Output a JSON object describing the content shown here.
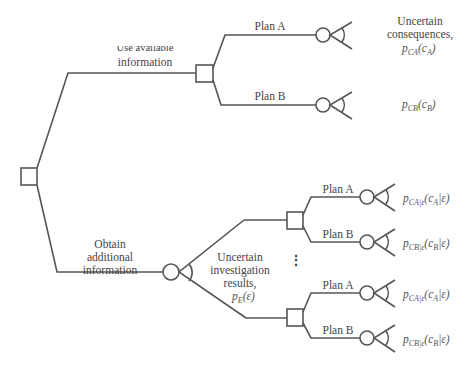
{
  "colors": {
    "line": "#555555",
    "text": "#444444",
    "background": "#ffffff"
  },
  "root": {
    "type": "decision",
    "shape": "square"
  },
  "branches": {
    "use_available": {
      "label_line1": "Use available",
      "label_line2": "information",
      "decision_node": "square",
      "plans": [
        {
          "label": "Plan A",
          "chance_node": "circle",
          "outcome_label_lines": [
            "Uncertain",
            "consequences,"
          ],
          "prob": {
            "p": "p",
            "sub": "CA",
            "arg": "c",
            "argsub": "A"
          }
        },
        {
          "label": "Plan B",
          "chance_node": "circle",
          "prob": {
            "p": "p",
            "sub": "CB",
            "arg": "c",
            "argsub": "B"
          }
        }
      ]
    },
    "obtain_additional": {
      "label_lines": [
        "Obtain",
        "additional",
        "information"
      ],
      "chance_node": "circle",
      "chance_label_lines": [
        "Uncertain",
        "investigation",
        "results,"
      ],
      "chance_prob": {
        "p": "p",
        "sub": "E",
        "arg": "(ε)"
      },
      "ellipsis": "⋮",
      "sub_decisions": [
        {
          "plans": [
            {
              "label": "Plan A",
              "prob": {
                "p": "p",
                "sub": "CA|ε",
                "arg": "c",
                "argsub": "A",
                "cond": "|ε)"
              }
            },
            {
              "label": "Plan B",
              "prob": {
                "p": "p",
                "sub": "CB|ε",
                "arg": "c",
                "argsub": "B",
                "cond": "|ε)"
              }
            }
          ]
        },
        {
          "plans": [
            {
              "label": "Plan A",
              "prob": {
                "p": "p",
                "sub": "CA|ε",
                "arg": "c",
                "argsub": "A",
                "cond": "|ε)"
              }
            },
            {
              "label": "Plan B",
              "prob": {
                "p": "p",
                "sub": "CB|ε",
                "arg": "c",
                "argsub": "B",
                "cond": "|ε)"
              }
            }
          ]
        }
      ]
    }
  }
}
